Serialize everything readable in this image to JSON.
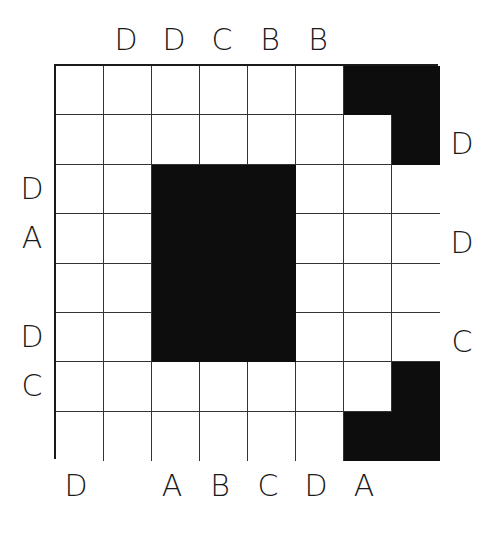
{
  "puzzle": {
    "rows": 8,
    "cols": 8,
    "black_cells": [
      [
        0,
        6
      ],
      [
        0,
        7
      ],
      [
        1,
        7
      ],
      [
        2,
        2
      ],
      [
        2,
        3
      ],
      [
        2,
        4
      ],
      [
        3,
        2
      ],
      [
        3,
        3
      ],
      [
        3,
        4
      ],
      [
        4,
        2
      ],
      [
        4,
        3
      ],
      [
        4,
        4
      ],
      [
        5,
        2
      ],
      [
        5,
        3
      ],
      [
        5,
        4
      ],
      [
        6,
        7
      ],
      [
        7,
        6
      ],
      [
        7,
        7
      ]
    ],
    "colors": {
      "black": "#0d0d0d",
      "line": "#333333",
      "background": "#ffffff"
    }
  },
  "clues": {
    "top": [
      "",
      "D",
      "D",
      "C",
      "B",
      "B",
      "",
      ""
    ],
    "bottom": [
      "D",
      "",
      "A",
      "B",
      "C",
      "D",
      "A",
      ""
    ],
    "left": [
      "",
      "",
      "D",
      "A",
      "",
      "D",
      "C",
      ""
    ],
    "right": [
      "",
      "D",
      "",
      "D",
      "",
      "C",
      "",
      ""
    ]
  }
}
